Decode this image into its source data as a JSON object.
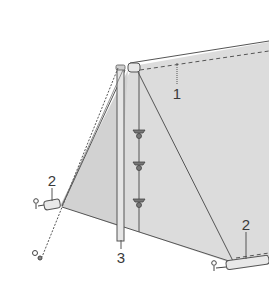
{
  "diagram": {
    "colors": {
      "fabric": "#d9d9d9",
      "line": "#555555",
      "background": "#ffffff"
    },
    "labels": [
      {
        "id": "1",
        "text": "1",
        "x": 177,
        "y": 93,
        "target": "rolled top edge"
      },
      {
        "id": "2a",
        "text": "2",
        "x": 52,
        "y": 180,
        "target": "left roll end"
      },
      {
        "id": "2b",
        "text": "2",
        "x": 246,
        "y": 224,
        "target": "right roll end"
      },
      {
        "id": "3",
        "text": "3",
        "x": 121,
        "y": 257,
        "target": "pole"
      }
    ]
  }
}
